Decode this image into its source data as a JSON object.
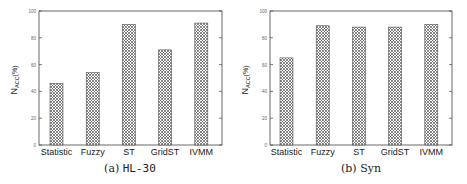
{
  "chart_data": [
    {
      "type": "bar",
      "title": "",
      "caption_label": "(a)",
      "caption_name": "HL-30",
      "xlabel": "",
      "ylabel": "N_ACC(%)",
      "ylabel_main": "N",
      "ylabel_sub": "ACC",
      "ylabel_suffix": "(%)",
      "ylim": [
        0,
        100
      ],
      "yticks": [
        0,
        20,
        40,
        60,
        80,
        100
      ],
      "grid": false,
      "legend": null,
      "bar_pattern": "crosshatch",
      "categories": [
        "Statistic",
        "Fuzzy",
        "ST",
        "GridST",
        "IVMM"
      ],
      "values": [
        46,
        54,
        90,
        71,
        91
      ]
    },
    {
      "type": "bar",
      "title": "",
      "caption_label": "(b)",
      "caption_name": "Syn",
      "xlabel": "",
      "ylabel": "N_ACC(%)",
      "ylabel_main": "N",
      "ylabel_sub": "ACC",
      "ylabel_suffix": "(%)",
      "ylim": [
        0,
        100
      ],
      "yticks": [
        0,
        20,
        40,
        60,
        80,
        100
      ],
      "grid": false,
      "legend": null,
      "bar_pattern": "crosshatch",
      "categories": [
        "Statistic",
        "Fuzzy",
        "ST",
        "GridST",
        "IVMM"
      ],
      "values": [
        65,
        89,
        88,
        88,
        90
      ]
    }
  ],
  "colors": {
    "axis": "#444444",
    "bar_fill": "#ffffff",
    "bar_hatch": "#555555",
    "text": "#222222"
  }
}
